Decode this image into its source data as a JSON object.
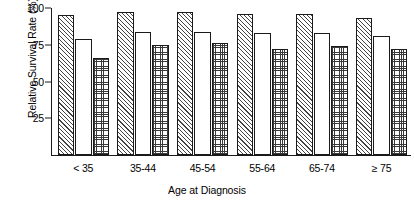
{
  "chart_data": {
    "type": "bar",
    "title": "",
    "xlabel": "Age at Diagnosis",
    "ylabel": "Relative Survival Rate (%)",
    "categories": [
      "< 35",
      "35-44",
      "45-54",
      "55-64",
      "65-74",
      "≥ 75"
    ],
    "series": [
      {
        "name": "series-1",
        "pattern": "diagonal-hatch",
        "values": [
          95,
          97,
          97,
          96,
          96,
          93
        ]
      },
      {
        "name": "series-2",
        "pattern": "blank",
        "values": [
          79,
          84,
          84,
          83,
          83,
          81
        ]
      },
      {
        "name": "series-3",
        "pattern": "fine-dotted",
        "values": [
          66,
          75,
          76,
          72,
          74,
          72
        ]
      }
    ],
    "ylim": [
      0,
      100
    ],
    "yticks": [
      25,
      50,
      75,
      100
    ],
    "ytick_labels": [
      "25",
      "50",
      "75",
      "100"
    ],
    "grid": false,
    "legend": "none",
    "axis_color": "#1a1a1a",
    "background_color": "#ffffff"
  }
}
